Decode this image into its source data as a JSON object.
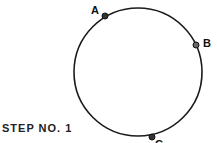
{
  "diagram": {
    "step_label": "STEP NO. 1",
    "circle": {
      "cx": 138,
      "cy": 72,
      "r": 64
    },
    "points": [
      {
        "label": "A",
        "x": 105,
        "y": 16,
        "lx": 91,
        "ly": 14
      },
      {
        "label": "B",
        "x": 196,
        "y": 45,
        "lx": 203,
        "ly": 47
      },
      {
        "label": "C",
        "x": 152,
        "y": 137,
        "lx": 155,
        "ly": 148
      }
    ],
    "colors": {
      "stroke": "#1a1a1a",
      "background": "#ffffff"
    }
  }
}
